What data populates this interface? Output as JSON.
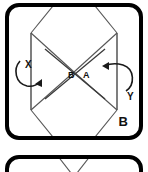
{
  "figure": {
    "panels": [
      {
        "id": "panel-b",
        "letter": "B",
        "labels": {
          "left_crossing": "B",
          "right_crossing": "A",
          "axis_left": "X",
          "axis_right": "Y"
        }
      },
      {
        "id": "panel-next",
        "letter": ""
      }
    ],
    "colors": {
      "panel_border": "#000000",
      "panel_fill": "#ffffff",
      "fold_line": "#555555",
      "arrow": "#1a1a1a",
      "text": "#111111"
    }
  }
}
